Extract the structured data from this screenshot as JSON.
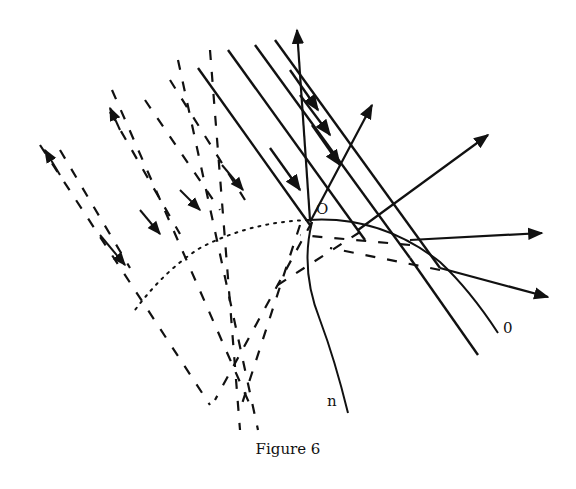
{
  "figure": {
    "caption": "Figure 6",
    "labels": {
      "origin": "O",
      "curve_end": "0",
      "normal_curve": "n"
    },
    "colors": {
      "ink": "#111111",
      "paper": "#ffffff"
    }
  }
}
